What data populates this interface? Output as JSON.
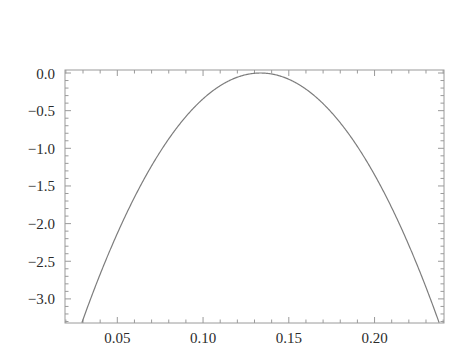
{
  "figure": {
    "title": "Standardized log−likelihood",
    "subtitle_prefix": "Interest function: ",
    "subtitle_symbol": "β",
    "subtitle_subscript": "3",
    "background_color": "#ffffff",
    "frame_color": "#9a9a9a",
    "curve_color": "#7d7d7d",
    "text_color": "#2b2b2b"
  },
  "chart_data": {
    "type": "line",
    "title": "Standardized log−likelihood",
    "subtitle": "Interest function: β3",
    "xlabel": "",
    "ylabel": "",
    "xlim": [
      0.0195,
      0.2405
    ],
    "ylim": [
      -3.32,
      0.04
    ],
    "grid": false,
    "legend": false,
    "x_ticks": [
      0.05,
      0.1,
      0.15,
      0.2
    ],
    "x_tick_labels": [
      "0.05",
      "0.10",
      "0.15",
      "0.20"
    ],
    "x_minor_ticks_between": 4,
    "y_ticks": [
      0.0,
      -0.5,
      -1.0,
      -1.5,
      -2.0,
      -2.5,
      -3.0
    ],
    "y_tick_labels": [
      "0.0",
      "−0.5",
      "−1.0",
      "−1.5",
      "−2.0",
      "−2.5",
      "−3.0"
    ],
    "y_minor_ticks_between": 4,
    "series": [
      {
        "name": "standardized log-likelihood",
        "peak_x": 0.1335,
        "peak_y": 0.0,
        "curvature_scale": 0.0572,
        "x": [
          0.0195,
          0.029,
          0.0385,
          0.048,
          0.0575,
          0.067,
          0.0765,
          0.086,
          0.0955,
          0.105,
          0.1145,
          0.124,
          0.1335,
          0.143,
          0.1525,
          0.162,
          0.1715,
          0.181,
          0.1905,
          0.2,
          0.2095,
          0.219,
          0.2285,
          0.238,
          0.2405
        ],
        "y": [
          -3.96,
          -3.36,
          -2.81,
          -2.3,
          -1.84,
          -1.42,
          -1.05,
          -0.72,
          -0.44,
          -0.25,
          -0.11,
          -0.03,
          0.0,
          -0.03,
          -0.11,
          -0.25,
          -0.44,
          -0.72,
          -1.05,
          -1.42,
          -1.84,
          -2.3,
          -2.81,
          -3.36,
          -3.55
        ]
      }
    ]
  }
}
